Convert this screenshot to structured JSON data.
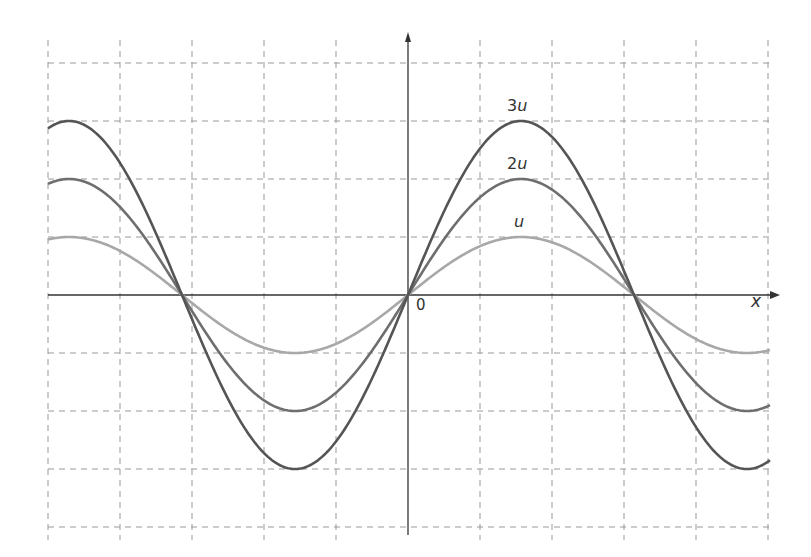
{
  "chart_data": {
    "type": "line",
    "title": "",
    "xlabel": "x",
    "ylabel": "",
    "origin_label": "0",
    "grid": true,
    "grid_style": "dashed",
    "series": [
      {
        "name": "3u",
        "amplitude": 3,
        "color": "#555555",
        "label_num": "3",
        "label_var": "u"
      },
      {
        "name": "2u",
        "amplitude": 2,
        "color": "#6e6e6e",
        "label_num": "2",
        "label_var": "u"
      },
      {
        "name": "u",
        "amplitude": 1,
        "color": "#a8a8a8",
        "label_num": "",
        "label_var": "u"
      }
    ],
    "function": "y = A * sin(2*pi*x/period)",
    "period_grid_units": 6.28,
    "zero_crossings_grid_units": [
      -3.14,
      0,
      3.14
    ],
    "x_range_grid_units": [
      -5,
      5
    ],
    "y_range_grid_units": [
      -4,
      4
    ]
  }
}
